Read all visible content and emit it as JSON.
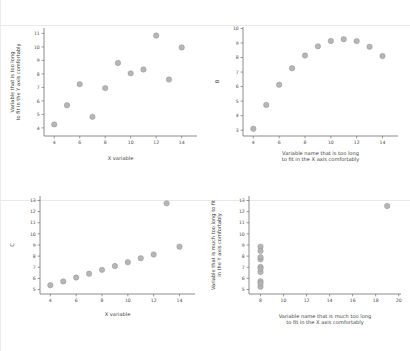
{
  "figure": {
    "background": "#ffffff",
    "marker_color": "#b2b2b2",
    "marker_edge_color": "#8e8e8e",
    "axis_color": "#6f6f6f",
    "text_color": "#3d3d3d",
    "panel_count": 4
  },
  "chart_data": [
    {
      "type": "scatter",
      "panel": "A",
      "title": "",
      "xlabel": "X variable",
      "ylabel": "Variable that is too long\nto fit in the Y axis comfortably",
      "ylabel_lines": [
        "Variable that is too long",
        "to fit in the Y axis comfortably"
      ],
      "xlabel_lines": [
        "X variable"
      ],
      "xlim": [
        3.2,
        15.2
      ],
      "ylim": [
        3.4,
        11.4
      ],
      "xticks": [
        4,
        6,
        8,
        10,
        12,
        14
      ],
      "yticks": [
        4,
        5,
        6,
        7,
        8,
        9,
        10,
        11
      ],
      "grid": false,
      "legend": false,
      "x": [
        10,
        8,
        13,
        9,
        11,
        14,
        6,
        4,
        12,
        7,
        5
      ],
      "y": [
        8.04,
        6.95,
        7.58,
        8.81,
        8.33,
        9.96,
        7.24,
        4.26,
        10.84,
        4.82,
        5.68
      ]
    },
    {
      "type": "scatter",
      "panel": "B",
      "title": "",
      "xlabel": "Variable name that is too long\nto fit in the X axis comfortably",
      "ylabel": "B",
      "ylabel_lines": [
        "B"
      ],
      "xlabel_lines": [
        "Variable name that is too long",
        "to fit in the X axis comfortably"
      ],
      "xlim": [
        3.2,
        15.2
      ],
      "ylim": [
        2.6,
        10.1
      ],
      "xticks": [
        4,
        6,
        8,
        10,
        12,
        14
      ],
      "yticks": [
        3,
        4,
        5,
        6,
        7,
        8,
        9,
        10
      ],
      "grid": false,
      "legend": false,
      "x": [
        10,
        8,
        13,
        9,
        11,
        14,
        6,
        4,
        12,
        7,
        5
      ],
      "y": [
        9.14,
        8.14,
        8.74,
        8.77,
        9.26,
        8.1,
        6.13,
        3.1,
        9.13,
        7.26,
        4.74
      ]
    },
    {
      "type": "scatter",
      "panel": "C",
      "title": "",
      "xlabel": "X variable",
      "ylabel": "C",
      "ylabel_lines": [
        "C"
      ],
      "xlabel_lines": [
        "X variable"
      ],
      "xlim": [
        3.2,
        15.2
      ],
      "ylim": [
        4.6,
        13.4
      ],
      "xticks": [
        4,
        6,
        8,
        10,
        12,
        14
      ],
      "yticks": [
        5,
        6,
        7,
        8,
        9,
        10,
        11,
        12,
        13
      ],
      "grid": false,
      "legend": false,
      "x": [
        10,
        8,
        13,
        9,
        11,
        14,
        6,
        4,
        12,
        7,
        5
      ],
      "y": [
        7.46,
        6.77,
        12.74,
        7.11,
        7.81,
        8.84,
        6.08,
        5.39,
        8.15,
        6.42,
        5.73
      ]
    },
    {
      "type": "scatter",
      "panel": "D",
      "title": "",
      "xlabel": "Variable name that is much too long\nto fit in the X axis comfortably",
      "ylabel": "Variable that is much too long to fit\nin the Y axis comfortably",
      "ylabel_lines": [
        "Variable that is much too long to fit",
        "in the Y axis comfortably"
      ],
      "xlabel_lines": [
        "Variable name that is much too long",
        "to fit in the X axis comfortably"
      ],
      "xlim": [
        7.0,
        20.2
      ],
      "ylim": [
        4.6,
        13.4
      ],
      "xticks": [
        8,
        10,
        12,
        14,
        16,
        18,
        20
      ],
      "yticks": [
        5,
        6,
        7,
        8,
        9,
        10,
        11,
        12,
        13
      ],
      "grid": false,
      "legend": false,
      "x": [
        8,
        8,
        8,
        8,
        8,
        8,
        8,
        19,
        8,
        8,
        8
      ],
      "y": [
        6.58,
        5.76,
        7.71,
        8.84,
        8.47,
        7.04,
        5.25,
        12.5,
        5.56,
        7.91,
        6.89
      ]
    }
  ]
}
